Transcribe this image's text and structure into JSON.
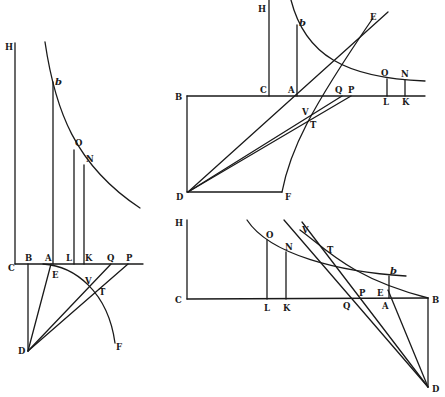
{
  "colors": {
    "ink": "#1a1a1a",
    "paper": "#ffffff"
  },
  "figures": [
    {
      "id": "figure-left",
      "lines": [
        [
          15,
          43,
          15,
          264
        ],
        [
          15,
          264,
          143,
          264
        ],
        [
          28,
          264,
          28,
          351
        ],
        [
          53,
          82,
          53,
          264
        ],
        [
          74,
          150,
          74,
          264
        ],
        [
          84,
          165,
          84,
          264
        ],
        [
          28,
          351,
          51,
          264
        ],
        [
          28,
          351,
          111,
          264
        ],
        [
          28,
          351,
          128,
          264
        ]
      ],
      "curves": [
        "M45,42 C55,110 75,165 140,208",
        "M43,264 C75,266 108,292 115,343"
      ],
      "labels": [
        {
          "t": "H",
          "x": 5,
          "y": 50
        },
        {
          "t": "b",
          "x": 55,
          "y": 85,
          "italic": true
        },
        {
          "t": "O",
          "x": 75,
          "y": 146
        },
        {
          "t": "N",
          "x": 86,
          "y": 162
        },
        {
          "t": "C",
          "x": 8,
          "y": 271
        },
        {
          "t": "B",
          "x": 25,
          "y": 261
        },
        {
          "t": "A",
          "x": 45,
          "y": 261
        },
        {
          "t": "L",
          "x": 66,
          "y": 261
        },
        {
          "t": "K",
          "x": 85,
          "y": 261
        },
        {
          "t": "Q",
          "x": 107,
          "y": 261
        },
        {
          "t": "P",
          "x": 126,
          "y": 261
        },
        {
          "t": "E",
          "x": 52,
          "y": 278
        },
        {
          "t": "V",
          "x": 85,
          "y": 284
        },
        {
          "t": "T",
          "x": 99,
          "y": 295
        },
        {
          "t": "D",
          "x": 18,
          "y": 354
        },
        {
          "t": "F",
          "x": 116,
          "y": 350
        }
      ]
    },
    {
      "id": "figure-top-right",
      "lines": [
        [
          269,
          0,
          269,
          96
        ],
        [
          187,
          96,
          425,
          96
        ],
        [
          187,
          96,
          187,
          192
        ],
        [
          187,
          192,
          282,
          192
        ],
        [
          297,
          25,
          297,
          96
        ],
        [
          387,
          79,
          387,
          96
        ],
        [
          405,
          80,
          405,
          96
        ],
        [
          188,
          192,
          388,
          12
        ],
        [
          188,
          192,
          342,
          96
        ],
        [
          188,
          192,
          351,
          96
        ]
      ],
      "curves": [
        "M291,0 C305,55 345,78 425,81",
        "M282,192 C290,150 310,110 373,18"
      ],
      "labels": [
        {
          "t": "H",
          "x": 258,
          "y": 12
        },
        {
          "t": "b",
          "x": 299,
          "y": 26,
          "italic": true
        },
        {
          "t": "E",
          "x": 370,
          "y": 20
        },
        {
          "t": "O",
          "x": 381,
          "y": 76
        },
        {
          "t": "N",
          "x": 401,
          "y": 77
        },
        {
          "t": "B",
          "x": 175,
          "y": 100
        },
        {
          "t": "C",
          "x": 260,
          "y": 93
        },
        {
          "t": "A",
          "x": 288,
          "y": 93
        },
        {
          "t": "Q",
          "x": 335,
          "y": 93
        },
        {
          "t": "P",
          "x": 348,
          "y": 93
        },
        {
          "t": "L",
          "x": 383,
          "y": 105
        },
        {
          "t": "K",
          "x": 402,
          "y": 105
        },
        {
          "t": "V",
          "x": 302,
          "y": 115
        },
        {
          "t": "T",
          "x": 310,
          "y": 128
        },
        {
          "t": "D",
          "x": 176,
          "y": 200
        },
        {
          "t": "F",
          "x": 285,
          "y": 200
        }
      ]
    },
    {
      "id": "figure-bottom-right",
      "lines": [
        [
          187,
          220,
          187,
          299
        ],
        [
          187,
          299,
          428,
          298
        ],
        [
          428,
          298,
          428,
          387
        ],
        [
          267,
          240,
          267,
          299
        ],
        [
          286,
          252,
          286,
          299
        ],
        [
          389,
          276,
          389,
          298
        ],
        [
          284,
          220,
          428,
          387
        ],
        [
          302,
          222,
          428,
          387
        ],
        [
          388,
          290,
          428,
          387
        ]
      ],
      "curves": [
        "M247,220 C270,255 340,272 406,276",
        "M300,230 C325,248 350,278 428,298"
      ],
      "labels": [
        {
          "t": "H",
          "x": 175,
          "y": 226
        },
        {
          "t": "O",
          "x": 266,
          "y": 238
        },
        {
          "t": "N",
          "x": 285,
          "y": 250
        },
        {
          "t": "V",
          "x": 302,
          "y": 233
        },
        {
          "t": "T",
          "x": 327,
          "y": 253
        },
        {
          "t": "b",
          "x": 390,
          "y": 274,
          "italic": true
        },
        {
          "t": "C",
          "x": 175,
          "y": 303
        },
        {
          "t": "L",
          "x": 264,
          "y": 311
        },
        {
          "t": "K",
          "x": 283,
          "y": 311
        },
        {
          "t": "Q",
          "x": 343,
          "y": 309
        },
        {
          "t": "P",
          "x": 359,
          "y": 296
        },
        {
          "t": "E",
          "x": 377,
          "y": 296
        },
        {
          "t": "A",
          "x": 382,
          "y": 309
        },
        {
          "t": "B",
          "x": 432,
          "y": 303
        },
        {
          "t": "D",
          "x": 432,
          "y": 392
        }
      ]
    }
  ]
}
